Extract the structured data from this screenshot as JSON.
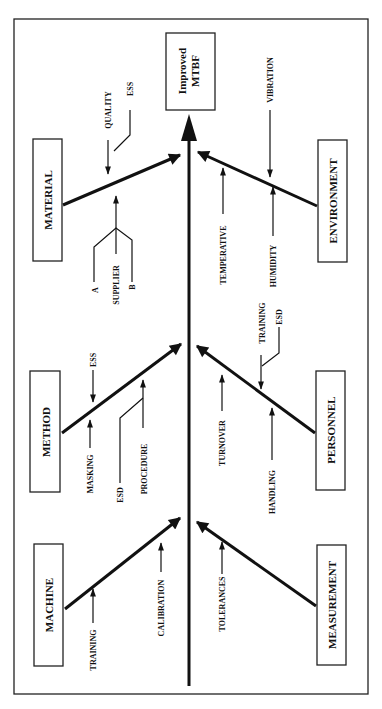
{
  "diagram": {
    "type": "fishbone",
    "effect": {
      "line1": "Improved",
      "line2": "MTBF"
    },
    "categories": {
      "material": {
        "label": "MATERIAL",
        "causes": [
          "QUALITY",
          "ESS",
          "SUPPLIER",
          "A",
          "B"
        ]
      },
      "environment": {
        "label": "ENVIRONMENT",
        "causes": [
          "VIBRATION",
          "TEMPERATIVE",
          "HUMIDITY"
        ]
      },
      "method": {
        "label": "METHOD",
        "causes": [
          "ESS",
          "MASKING",
          "ESD",
          "PROCEDURE"
        ]
      },
      "personnel": {
        "label": "PERSONNEL",
        "causes": [
          "TRAINING",
          "ESD",
          "TURNOVER",
          "HANDLING"
        ]
      },
      "machine": {
        "label": "MACHINE",
        "causes": [
          "TRAINING",
          "CALIBRATION"
        ]
      },
      "measurement": {
        "label": "MEASUREMENT",
        "causes": [
          "TOLERANCES"
        ]
      }
    }
  }
}
